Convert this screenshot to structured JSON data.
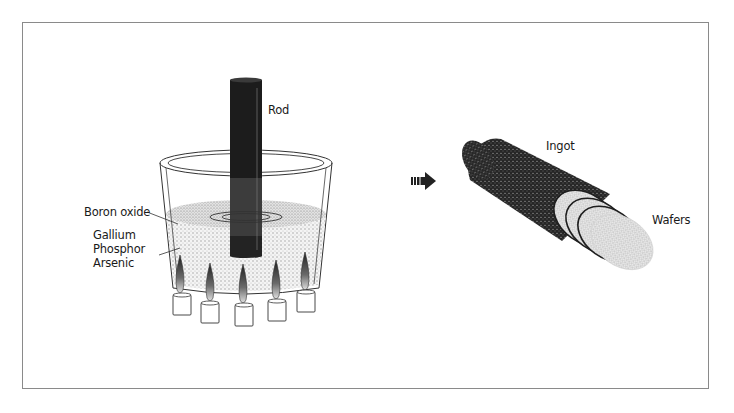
{
  "figure": {
    "left_panel": {
      "labels": {
        "rod": "Rod",
        "boron_oxide": "Boron oxide",
        "melt_line1": "Gallium",
        "melt_line2": "Phosphor",
        "melt_line3": "Arsenic"
      },
      "burner_count": 5
    },
    "arrow": {
      "icon": "right-arrow-icon"
    },
    "right_panel": {
      "labels": {
        "ingot": "Ingot",
        "wafers": "Wafers"
      },
      "wafer_count": 4
    },
    "colors": {
      "border": "#8a8a8a",
      "rod": "#1c1c1c",
      "rod_submerged": "#3a3a3a",
      "ingot": "#2a2a2a",
      "wafer": "#d8d8d8",
      "stipple": "#bdbdbd"
    }
  }
}
